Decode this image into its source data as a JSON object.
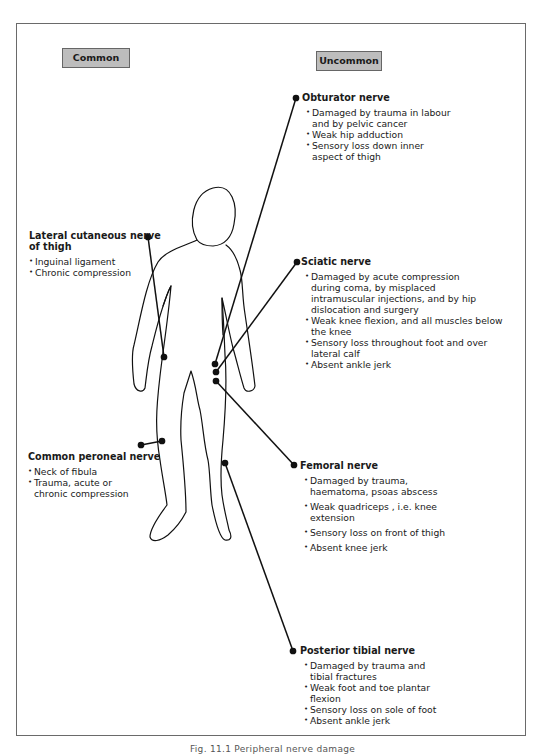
{
  "categories": {
    "common": "Common",
    "uncommon": "Uncommon"
  },
  "nerves": {
    "obturator": {
      "title": "Obturator nerve",
      "points": [
        "Damaged by trauma in labour\n   and by pelvic cancer",
        "Weak hip adduction",
        "Sensory loss down inner\naspect of thigh"
      ]
    },
    "lateral_cutaneous": {
      "title_line1": "Lateral cutaneous nerve",
      "title_line2": "of thigh",
      "points": [
        "Inguinal ligament",
        "Chronic compression"
      ]
    },
    "sciatic": {
      "title": "Sciatic nerve",
      "points": [
        "Damaged by acute compression\n   during coma, by misplaced\n   intramuscular injections, and by hip\n   dislocation and surgery",
        "Weak knee flexion, and all muscles below\n   the knee",
        "Sensory loss throughout foot and over\n   lateral calf",
        "Absent ankle jerk"
      ]
    },
    "common_peroneal": {
      "title": "Common peroneal nerve",
      "points": [
        "Neck of fibula",
        "Trauma, acute or\n   chronic compression"
      ]
    },
    "femoral": {
      "title": "Femoral nerve",
      "points": [
        "Damaged by trauma,\n   haematoma, psoas abscess",
        "Weak quadriceps , i.e. knee\n   extension",
        "Sensory loss on front of thigh",
        "Absent knee jerk"
      ]
    },
    "posterior_tibial": {
      "title": "Posterior tibial nerve",
      "points": [
        "Damaged by trauma and\n   tibial fractures",
        "Weak foot and toe plantar\n   flexion",
        "Sensory loss on sole of foot",
        "Absent ankle jerk"
      ]
    }
  },
  "caption": "Fig. 11.1  Peripheral nerve damage"
}
